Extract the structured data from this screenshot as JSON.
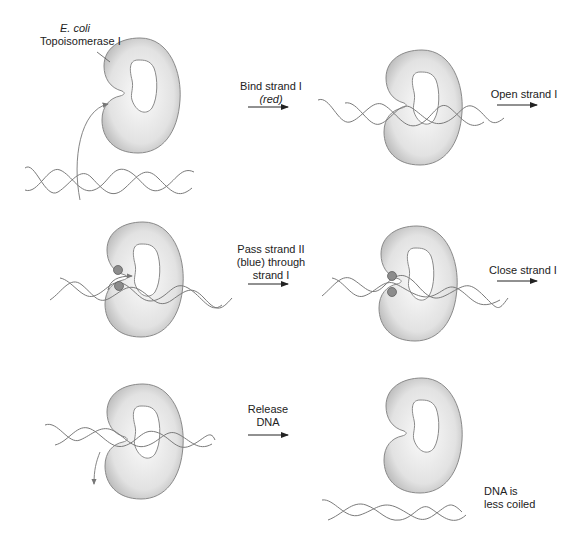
{
  "enzyme_label": {
    "line1": "E. coli",
    "line2": "Topoisomerase I"
  },
  "steps": [
    {
      "label_lines": [
        "Bind strand I",
        "(red)"
      ],
      "arrow": "right-arrow"
    },
    {
      "label_lines": [
        "Open strand I"
      ],
      "arrow": "right-arrow"
    },
    {
      "label_lines": [
        "Pass strand II",
        "(blue) through",
        "strand I"
      ],
      "arrow": "right-arrow"
    },
    {
      "label_lines": [
        "Close strand I"
      ],
      "arrow": "right-arrow"
    },
    {
      "label_lines": [
        "Release",
        "DNA"
      ],
      "arrow": "right-arrow"
    }
  ],
  "result_label": {
    "line1": "DNA is",
    "line2": "less coiled"
  },
  "colors": {
    "enzyme_fill": "#e6e6e6",
    "enzyme_edge": "#8a8a8a",
    "dna_strand": "#7a7a7a",
    "active_site": "#8c8c8c",
    "arrow": "#222222"
  }
}
